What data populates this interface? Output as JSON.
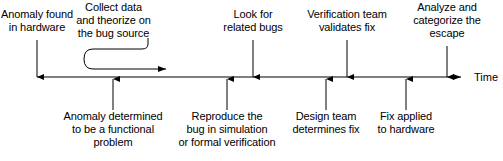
{
  "diagram": {
    "axis": {
      "name": "Time",
      "label": "Time",
      "color": "#000000",
      "start_x": 37,
      "end_x": 468,
      "y": 77
    },
    "line_color": "#000000",
    "text_color": "#000000",
    "background": "#ffffff"
  },
  "events_above": [
    {
      "id": "anomaly-found",
      "label": "Anomaly found\nin hardware",
      "tick_x": 37,
      "label_cx": 37,
      "label_top": 8,
      "arrow_top": 40
    },
    {
      "id": "collect-data",
      "label": "Collect data\nand theorize on\nthe bug source",
      "tick_x": 148,
      "label_cx": 113,
      "label_top": 1,
      "arrow_top": 38,
      "loop": true
    },
    {
      "id": "look-related-bugs",
      "label": "Look for\nrelated bugs",
      "tick_x": 253,
      "label_cx": 253,
      "label_top": 8,
      "arrow_top": 40
    },
    {
      "id": "verification-validates",
      "label": "Verification team\nvalidates fix",
      "tick_x": 347,
      "label_cx": 347,
      "label_top": 8,
      "arrow_top": 40
    },
    {
      "id": "analyze-escape",
      "label": "Analyze and\ncategorize the\nescape",
      "tick_x": 447,
      "label_cx": 447,
      "label_top": 1,
      "arrow_top": 46
    }
  ],
  "events_below": [
    {
      "id": "anomaly-functional",
      "label": "Anomaly determined\nto be a functional\nproblem",
      "tick_x": 113,
      "label_cx": 113,
      "label_top": 110,
      "arrow_bottom": 110
    },
    {
      "id": "reproduce-bug",
      "label": "Reproduce the\nbug in simulation\nor formal verification",
      "tick_x": 227,
      "label_cx": 227,
      "label_top": 110,
      "arrow_bottom": 110
    },
    {
      "id": "design-determines-fix",
      "label": "Design team\ndetermines fix",
      "tick_x": 326,
      "label_cx": 326,
      "label_top": 110,
      "arrow_bottom": 110
    },
    {
      "id": "fix-applied",
      "label": "Fix applied\nto hardware",
      "tick_x": 406,
      "label_cx": 406,
      "label_top": 110,
      "arrow_bottom": 110
    }
  ],
  "loop_arrow": {
    "name": "collect-data-loop-arrow",
    "description": "U-turn feedback loop from the collect-data label back along the timeline",
    "start_x": 148,
    "start_y": 38,
    "left_x": 84,
    "top_y": 48,
    "bottom_y": 70,
    "arrow_end_x": 172
  }
}
